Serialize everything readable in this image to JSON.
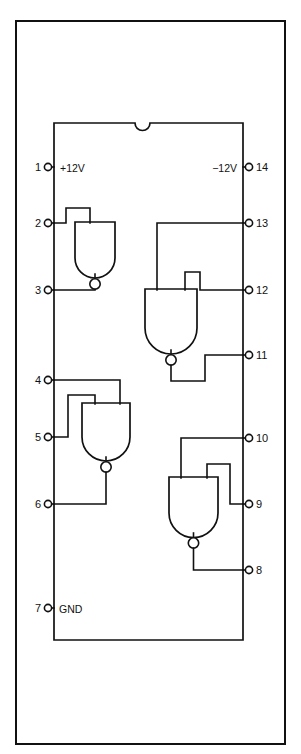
{
  "figure": {
    "type": "schematic",
    "package": {
      "pin_count": 14,
      "notch": "top-center semicircular keying notch",
      "outline_color": "#111111"
    },
    "power_labels": {
      "vcc": "+12V",
      "vee": "−12V",
      "gnd": "GND"
    },
    "pins_left": [
      {
        "number": "1",
        "label": "+12V"
      },
      {
        "number": "2",
        "label": ""
      },
      {
        "number": "3",
        "label": ""
      },
      {
        "number": "4",
        "label": ""
      },
      {
        "number": "5",
        "label": ""
      },
      {
        "number": "6",
        "label": ""
      },
      {
        "number": "7",
        "label": "GND"
      }
    ],
    "pins_right": [
      {
        "number": "14",
        "label": "−12V"
      },
      {
        "number": "13",
        "label": ""
      },
      {
        "number": "12",
        "label": ""
      },
      {
        "number": "11",
        "label": ""
      },
      {
        "number": "10",
        "label": ""
      },
      {
        "number": "9",
        "label": ""
      },
      {
        "number": "8",
        "label": ""
      }
    ],
    "gates": [
      {
        "id": "gate-a",
        "type": "NAND",
        "inputs": [
          "2",
          "3"
        ],
        "output": "1-side-upper-left"
      },
      {
        "id": "gate-b",
        "type": "NAND",
        "inputs": [
          "13",
          "12"
        ],
        "output": "11"
      },
      {
        "id": "gate-c",
        "type": "NAND",
        "inputs": [
          "4",
          "5"
        ],
        "output": "6"
      },
      {
        "id": "gate-d",
        "type": "NAND",
        "inputs": [
          "10",
          "9"
        ],
        "output": "8"
      }
    ],
    "caption": ""
  }
}
